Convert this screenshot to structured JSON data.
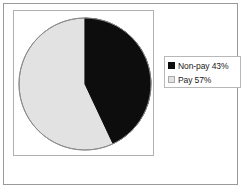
{
  "chart_data": {
    "type": "pie",
    "title": "",
    "subtitle": "",
    "xlabel": "",
    "ylabel": "",
    "grid": false,
    "legend_position": "right",
    "categories": [
      "Non-pay",
      "Pay"
    ],
    "values": [
      43,
      57
    ],
    "units": "%",
    "start_angle_deg": 0,
    "direction": "clockwise",
    "slices": [
      {
        "label": "Non-pay",
        "value": 43,
        "display": "43%",
        "legend_text": "Non-pay 43%",
        "color": "#0d0d0d",
        "edge_color": "#0d0d0d"
      },
      {
        "label": "Pay",
        "value": 57,
        "display": "57%",
        "legend_text": "Pay 57%",
        "color": "#e2e2e2",
        "edge_color": "#8c8c8c"
      }
    ]
  },
  "legend": {
    "items": [
      {
        "label": "Non-pay 43%",
        "swatch": "black-swatch-icon"
      },
      {
        "label": "Pay 57%",
        "swatch": "gray-swatch-icon"
      }
    ]
  },
  "colors": {
    "non_pay": "#0d0d0d",
    "pay": "#e2e2e2",
    "pie_outline": "#8c8c8c",
    "frame": "#9a9a9a",
    "plot_border": "#b0b0b0",
    "legend_border": "#b8b8b8",
    "background": "#ffffff",
    "text": "#1a1a1a"
  }
}
